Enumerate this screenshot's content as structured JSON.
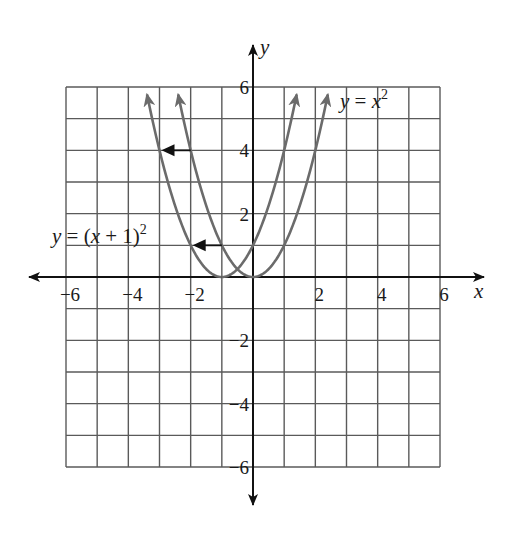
{
  "chart_data": {
    "type": "line",
    "title": "",
    "xlabel": "x",
    "ylabel": "y",
    "xlim": [
      -6,
      6
    ],
    "ylim": [
      -6,
      6
    ],
    "grid": true,
    "grid_step": 1,
    "x_ticks": [
      -6,
      -4,
      -2,
      2,
      4,
      6
    ],
    "y_ticks": [
      -6,
      -4,
      -2,
      2,
      4,
      6
    ],
    "x_tick_labels": [
      "−6",
      "−4",
      "−2",
      "2",
      "4",
      "6"
    ],
    "y_tick_labels": [
      "−6",
      "−4",
      "−2",
      "2",
      "4",
      "6"
    ],
    "series": [
      {
        "name": "y = x^2",
        "label": "y = x²",
        "function": "x^2",
        "vertex": [
          0,
          0
        ],
        "x": [
          -2.4,
          -2,
          -1,
          0,
          1,
          2,
          2.4
        ],
        "y": [
          5.76,
          4,
          1,
          0,
          1,
          4,
          5.76
        ],
        "color": "#6b6b6b"
      },
      {
        "name": "y = (x + 1)^2",
        "label": "y = (x + 1)²",
        "function": "(x+1)^2",
        "vertex": [
          -1,
          0
        ],
        "x": [
          -3.4,
          -3,
          -2,
          -1,
          0,
          1,
          1.4
        ],
        "y": [
          5.76,
          4,
          1,
          0,
          1,
          4,
          5.76
        ],
        "color": "#6b6b6b"
      }
    ],
    "annotations": [
      {
        "type": "arrow",
        "from": [
          -2,
          4
        ],
        "to": [
          -3,
          4
        ],
        "meaning": "shift left 1 unit"
      },
      {
        "type": "arrow",
        "from": [
          -1,
          1
        ],
        "to": [
          -2,
          1
        ],
        "meaning": "shift left 1 unit"
      }
    ]
  },
  "labels": {
    "x_axis": "x",
    "y_axis": "y",
    "eq_parent_y": "y",
    "eq_parent_eq": " = ",
    "eq_parent_x": "x",
    "eq_parent_exp": "2",
    "eq_shift_y": "y",
    "eq_shift_eq": " = (",
    "eq_shift_x": "x",
    "eq_shift_rest": " + 1)",
    "eq_shift_exp": "2"
  },
  "colors": {
    "curve": "#6b6b6b",
    "grid": "#5a5a5a",
    "axis": "#111111",
    "arrow": "#111111"
  }
}
